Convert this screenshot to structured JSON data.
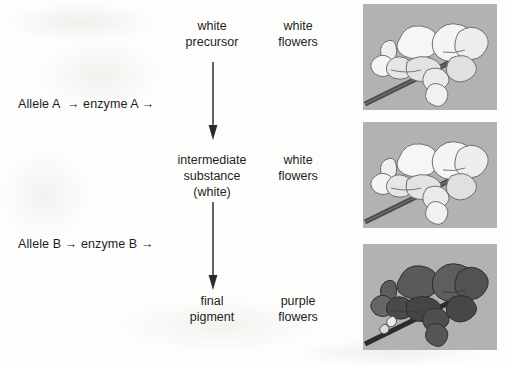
{
  "diagram": {
    "background_color": "#fdfdfc",
    "text_color": "#1e1e1e",
    "pathway": {
      "steps": [
        {
          "allele_label": "Allele A  → enzyme A →",
          "substance_lines": [
            "white",
            "precursor"
          ],
          "phenotype_lines": [
            "white",
            "flowers"
          ]
        },
        {
          "allele_label": "Allele B → enzyme B →",
          "substance_lines": [
            "intermediate",
            "substance",
            "(white)"
          ],
          "phenotype_lines": [
            "white",
            "flowers"
          ]
        },
        {
          "substance_lines": [
            "final",
            "pigment"
          ],
          "phenotype_lines": [
            "purple",
            "flowers"
          ]
        }
      ]
    },
    "panels": [
      {
        "caption": "white sweet pea flowers",
        "background_color": "#b2b2b2",
        "petal_color": "#f4f4f2",
        "petal_shade_color": "#d9d9d7",
        "outline_color": "#6e6e6e",
        "stem_color": "#4a4a4a"
      },
      {
        "caption": "white sweet pea flowers",
        "background_color": "#b2b2b2",
        "petal_color": "#f4f4f2",
        "petal_shade_color": "#d9d9d7",
        "outline_color": "#6e6e6e",
        "stem_color": "#4a4a4a"
      },
      {
        "caption": "purple sweet pea flowers",
        "background_color": "#b2b2b2",
        "petal_color": "#575757",
        "petal_shade_color": "#474747",
        "outline_color": "#2e2e2e",
        "stem_color": "#2b2b2b"
      }
    ],
    "arrows": [
      {
        "name": "precursor-to-intermediate",
        "direction": "down"
      },
      {
        "name": "intermediate-to-pigment",
        "direction": "down"
      }
    ]
  }
}
